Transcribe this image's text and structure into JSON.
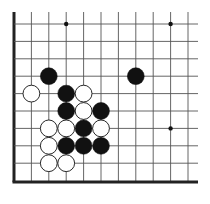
{
  "board": {
    "title": "Go board corner diagram",
    "origin_x": 14,
    "origin_y": 24,
    "spacing": 17.4,
    "columns": 11,
    "rows": 10,
    "edges": [
      "left",
      "bottom"
    ],
    "line_color": "#555555",
    "edge_color": "#222222",
    "star_points": [
      [
        3,
        0
      ],
      [
        9,
        0
      ],
      [
        9,
        6
      ]
    ],
    "stones": [
      {
        "color": "black",
        "col": 2,
        "row": 3
      },
      {
        "color": "black",
        "col": 7,
        "row": 3
      },
      {
        "color": "white",
        "col": 1,
        "row": 4
      },
      {
        "color": "black",
        "col": 3,
        "row": 4
      },
      {
        "color": "white",
        "col": 4,
        "row": 4
      },
      {
        "color": "black",
        "col": 3,
        "row": 5
      },
      {
        "color": "white",
        "col": 4,
        "row": 5
      },
      {
        "color": "black",
        "col": 5,
        "row": 5
      },
      {
        "color": "white",
        "col": 2,
        "row": 6
      },
      {
        "color": "white",
        "col": 3,
        "row": 6
      },
      {
        "color": "black",
        "col": 4,
        "row": 6
      },
      {
        "color": "white",
        "col": 5,
        "row": 6
      },
      {
        "color": "white",
        "col": 2,
        "row": 7
      },
      {
        "color": "black",
        "col": 3,
        "row": 7
      },
      {
        "color": "black",
        "col": 4,
        "row": 7
      },
      {
        "color": "black",
        "col": 5,
        "row": 7
      },
      {
        "color": "white",
        "col": 2,
        "row": 8
      },
      {
        "color": "white",
        "col": 3,
        "row": 8
      }
    ]
  }
}
